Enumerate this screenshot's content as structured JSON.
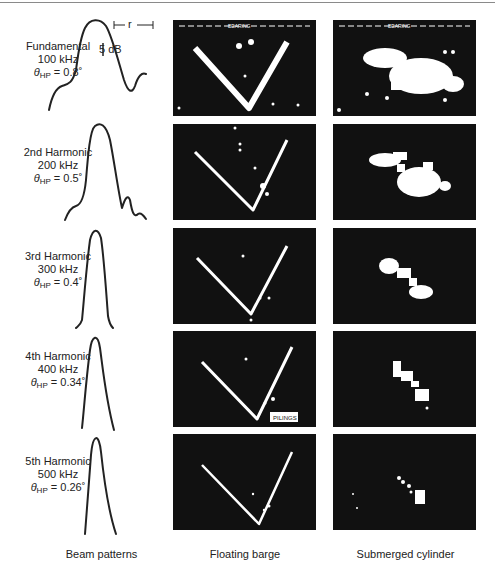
{
  "figure": {
    "rows": [
      {
        "name": "Fundamental",
        "freq": "100 kHz",
        "theta_label": "θ",
        "theta_sub": "HP",
        "theta_value": "= 0.8˚"
      },
      {
        "name": "2nd Harmonic",
        "freq": "200 kHz",
        "theta_label": "θ",
        "theta_sub": "HP",
        "theta_value": "= 0.5˚"
      },
      {
        "name": "3rd Harmonic",
        "freq": "300 kHz",
        "theta_label": "θ",
        "theta_sub": "HP",
        "theta_value": "= 0.4˚"
      },
      {
        "name": "4th Harmonic",
        "freq": "400 kHz",
        "theta_label": "θ",
        "theta_sub": "HP",
        "theta_value": "= 0.34˚"
      },
      {
        "name": "5th Harmonic",
        "freq": "500 kHz",
        "theta_label": "θ",
        "theta_sub": "HP",
        "theta_value": "= 0.26˚"
      }
    ],
    "annotations": {
      "scale_5db": "5 dB",
      "r_label": "r",
      "bearing_label": "BEARING",
      "pilings_label": "PILINGS"
    },
    "captions": {
      "beam": "Beam patterns",
      "barge": "Floating barge",
      "cylinder": "Submerged cylinder"
    },
    "colors": {
      "panel_bg": "#111111",
      "echo": "#ffffff",
      "line": "#222222"
    }
  }
}
